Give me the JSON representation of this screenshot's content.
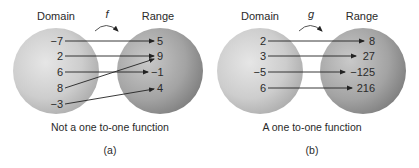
{
  "panels": [
    {
      "id": "a",
      "domain_label": "Domain",
      "range_label": "Range",
      "function_name": "f",
      "domain": [
        "−7",
        "2",
        "6",
        "8",
        "−3"
      ],
      "range": [
        "5",
        "9",
        "−1",
        "4"
      ],
      "mappings": [
        {
          "from": "−7",
          "to": "5"
        },
        {
          "from": "2",
          "to": "9"
        },
        {
          "from": "6",
          "to": "−1"
        },
        {
          "from": "8",
          "to": "9"
        },
        {
          "from": "−3",
          "to": "4"
        }
      ],
      "caption": "Not a one to-one function",
      "sublabel": "(a)"
    },
    {
      "id": "b",
      "domain_label": "Domain",
      "range_label": "Range",
      "function_name": "g",
      "domain": [
        "2",
        "3",
        "−5",
        "6"
      ],
      "range": [
        "8",
        "27",
        "−125",
        "216"
      ],
      "mappings": [
        {
          "from": "2",
          "to": "8"
        },
        {
          "from": "3",
          "to": "27"
        },
        {
          "from": "−5",
          "to": "−125"
        },
        {
          "from": "6",
          "to": "216"
        }
      ],
      "caption": "A one to-one function",
      "sublabel": "(b)"
    }
  ],
  "colors": {
    "domain_light": "#e4e4e4",
    "domain_dark": "#a9a9a9",
    "range_light": "#c4c4c4",
    "range_dark": "#7e7e7e",
    "arrow": "#222222"
  }
}
